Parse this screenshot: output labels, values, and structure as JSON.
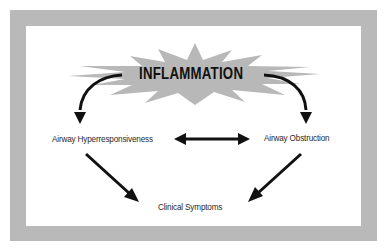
{
  "diagram": {
    "central_node": {
      "label": "INFLAMMATION",
      "shape": "starburst",
      "fill": "#b8b8b8"
    },
    "nodes": [
      {
        "id": "ahr",
        "label": "Airway Hyperresponsiveness"
      },
      {
        "id": "obs",
        "label": "Airway Obstruction"
      },
      {
        "id": "sym",
        "label": "Clinical Symptoms"
      }
    ],
    "edges": [
      {
        "from": "INFLAMMATION",
        "to": "Airway Hyperresponsiveness",
        "type": "curved-arrow"
      },
      {
        "from": "INFLAMMATION",
        "to": "Airway Obstruction",
        "type": "curved-arrow"
      },
      {
        "from": "Airway Hyperresponsiveness",
        "to": "Airway Obstruction",
        "type": "bidirectional-arrow"
      },
      {
        "from": "Airway Hyperresponsiveness",
        "to": "Clinical Symptoms",
        "type": "arrow"
      },
      {
        "from": "Airway Obstruction",
        "to": "Clinical Symptoms",
        "type": "arrow"
      }
    ],
    "colors": {
      "frame": "#b9b9b9",
      "background": "#ffffff",
      "arrow": "#111111",
      "starburst": "#b8b8b8"
    }
  }
}
